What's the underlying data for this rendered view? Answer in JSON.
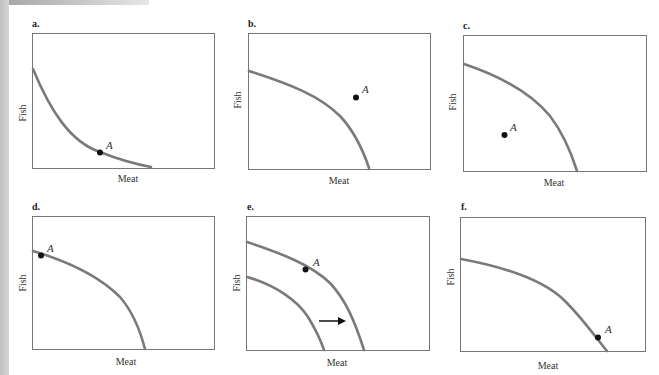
{
  "figure": {
    "colors": {
      "curve": "#7a7a7a",
      "frame": "#777777",
      "point": "#111111",
      "text": "#333333"
    },
    "panels": [
      {
        "id": "a",
        "label": "a.",
        "xlabel": "Meat",
        "ylabel": "Fish",
        "point_label": "A",
        "description": "Convex (bowed-in) curve; point A lies on the curve near the lower right"
      },
      {
        "id": "b",
        "label": "b.",
        "xlabel": "Meat",
        "ylabel": "Fish",
        "point_label": "A",
        "description": "Concave PPF; point A lies outside (beyond) the curve"
      },
      {
        "id": "c",
        "label": "c.",
        "xlabel": "Meat",
        "ylabel": "Fish",
        "point_label": "A",
        "description": "Concave PPF; point A lies inside the curve"
      },
      {
        "id": "d",
        "label": "d.",
        "xlabel": "Meat",
        "ylabel": "Fish",
        "point_label": "A",
        "description": "Concave PPF; point A on the curve near the Fish axis"
      },
      {
        "id": "e",
        "label": "e.",
        "xlabel": "Meat",
        "ylabel": "Fish",
        "point_label": "A",
        "description": "Two concave PPFs; outward shift shown by a right-pointing arrow; point A on outer curve"
      },
      {
        "id": "f",
        "label": "f.",
        "xlabel": "Meat",
        "ylabel": "Fish",
        "point_label": "A",
        "description": "Concave PPF; point A on the curve near the Meat axis"
      }
    ]
  }
}
